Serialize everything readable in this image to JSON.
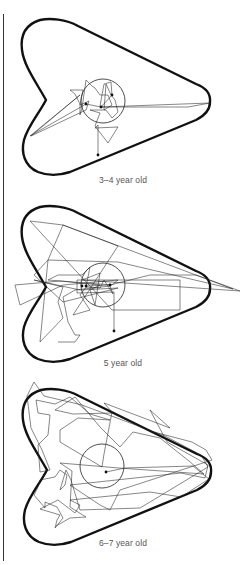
{
  "figure": {
    "panels": [
      {
        "caption": "3–4 year old",
        "boundary_color": "#111111",
        "path_color": "#222222",
        "top": 0,
        "caption_top": 175,
        "circle": {
          "cx": 103,
          "cy": 101,
          "r": 22
        },
        "path": "M98,155 L98,125 L95,128 L118,127 L108,143 L95,126 L100,113 L90,110 L106,110 L112,118 L118,112 L115,100 L111,95 L106,84 L104,110 L112,105 L108,95 L100,95 L95,88 L92,86 L86,80 L82,108 L80,115 L80,104 L75,94 L70,90 L83,90 L80,105 L89,101 L86,110 L31,136 L80,95 L30,136 L86,104 L101,107 L210,103 L188,107 L101,107 L112,95 L111,82 L104,84 L100,106",
        "dots": [
          [
            98,
            155
          ],
          [
            101,
            107
          ],
          [
            86,
            104
          ],
          [
            112,
            95
          ]
        ]
      },
      {
        "caption": "5 year old",
        "boundary_color": "#111111",
        "path_color": "#222222",
        "top": 185,
        "caption_top": 173,
        "circle": {
          "cx": 103,
          "cy": 100,
          "r": 22
        },
        "path": "M114,146 L114,107 L77,108 L77,95 L180,95 L180,125 L112,125 L30,36 L63,40 L233,104 L118,77 L48,75 L40,157 L63,133 L58,117 L63,102 L34,95 L80,105 L118,103 L63,117 L34,90 L48,75 L63,40 L118,61 L73,130 L90,125 L80,110 L87,101 L110,100 L150,90 L196,90 L240,106 L82,95 L100,88 L95,120 L90,105 L100,100 L60,96 L15,100 L20,120 L48,107 L63,100 L118,95 L112,100 L48,95 L58,90 L82,90 L90,82 L86,102 L100,103 L104,95 L113,109 L110,101 L75,105 L63,112 L68,137 L75,150 L80,150 L75,157 L58,157",
        "dots": [
          [
            114,
            146
          ],
          [
            82,
            101
          ],
          [
            86,
            101
          ],
          [
            110,
            100
          ]
        ]
      },
      {
        "caption": "6–7 year old",
        "boundary_color": "#111111",
        "path_color": "#222222",
        "top": 370,
        "caption_top": 168,
        "circle": {
          "cx": 102,
          "cy": 96,
          "r": 22
        },
        "path": "M106,102 L125,98 L193,96 L209,109 L181,127 L150,122 L70,130 L80,135 L75,143 L58,130 L40,139 L60,145 L57,150 L55,158 L63,148 L57,137 L45,132 L45,138 L34,125 L38,117 L40,110 L55,107 L60,100 L67,105 L65,115 L60,120 L66,100 L71,110 L80,140 L140,138 L208,97 L201,85 L165,66 L82,35 L44,26 L34,12 L27,26 L31,58 L36,68 L42,80 L50,100 L40,102 L38,75 L48,65 L50,45 L38,43 L36,30 L55,34 L70,27 L90,44 L110,50 L78,48 L60,60 L60,72 L102,97 L104,84 L112,42 L104,33 L170,58 L150,40 L167,72 L208,95 L205,108 L181,103 L70,115 L100,135 L110,140 L120,120 L212,90 L206,80 L192,72 L150,61 L112,43 L73,44 L55,40 L75,27 L100,57 L120,77 L133,62 L160,68 L189,91 L204,104 L119,98 L60,93 L72,101 L70,137 L86,147 L70,148 L56,156",
        "dots": [
          [
            106,
            102
          ]
        ]
      }
    ]
  }
}
